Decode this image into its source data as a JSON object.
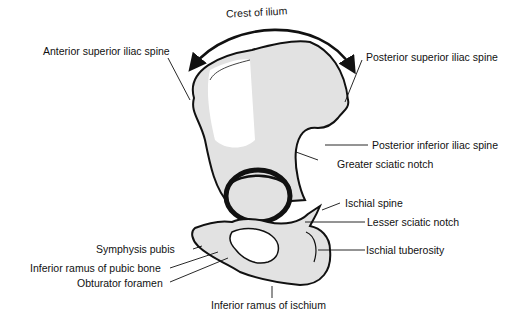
{
  "diagram": {
    "colors": {
      "outline": "#111111",
      "shading": "#e0e0e0",
      "background": "#ffffff"
    },
    "labels": {
      "crest_of_ilium": "Crest of ilium",
      "anterior_superior_iliac_spine": "Anterior superior iliac spine",
      "posterior_superior_iliac_spine": "Posterior superior iliac spine",
      "posterior_inferior_iliac_spine": "Posterior inferior iliac spine",
      "greater_sciatic_notch": "Greater sciatic notch",
      "ischial_spine": "Ischial spine",
      "lesser_sciatic_notch": "Lesser sciatic notch",
      "ischial_tuberosity": "Ischial tuberosity",
      "symphysis_pubis": "Symphysis pubis",
      "inferior_ramus_of_pubic_bone": "Inferior ramus of pubic bone",
      "obturator_foramen": "Obturator foramen",
      "inferior_ramus_of_ischium": "Inferior ramus of ischium"
    }
  }
}
